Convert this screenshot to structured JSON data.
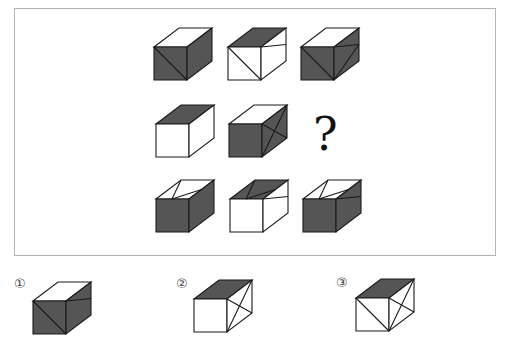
{
  "colors": {
    "dark": "#555555",
    "light": "#ffffff",
    "stroke": "#1a1a1a",
    "frame": "#b4b4b4"
  },
  "puzzle": {
    "question_mark": "?",
    "grid": [
      [
        {
          "id": "r1c1",
          "top": "light",
          "front": "dark",
          "right": "dark",
          "front_lines": [
            "tl-br"
          ],
          "right_lines": [],
          "top_lines": []
        },
        {
          "id": "r1c2",
          "top": "dark",
          "front": "light",
          "right": "light",
          "front_lines": [
            "tl-br"
          ],
          "right_lines": [
            "tl-mr"
          ],
          "top_lines": []
        },
        {
          "id": "r1c3",
          "top": "light",
          "front": "dark",
          "right": "dark",
          "front_lines": [
            "tl-br"
          ],
          "right_lines": [
            "tl-mr",
            "mr-bl"
          ],
          "top_lines": []
        }
      ],
      [
        {
          "id": "r2c1",
          "top": "dark",
          "front": "light",
          "right": "light",
          "front_lines": [],
          "right_lines": [],
          "top_lines": []
        },
        {
          "id": "r2c2",
          "top": "light",
          "front": "dark",
          "right": "dark",
          "front_lines": [],
          "right_lines": [
            "tr-bl",
            "tl-br"
          ],
          "top_lines": []
        },
        null
      ],
      [
        {
          "id": "r3c1",
          "top": "light",
          "front": "light",
          "right": "dark",
          "front_lines": [],
          "right_lines": [],
          "top_lines": [
            "back-fl",
            "back-mr"
          ],
          "front_dark": true
        },
        {
          "id": "r3c2",
          "top": "dark",
          "front": "light",
          "right": "light",
          "front_lines": [],
          "right_lines": [
            "tl-mr"
          ],
          "top_lines": [
            "back-fl",
            "back-mr"
          ]
        },
        {
          "id": "r3c3",
          "top": "light",
          "front": "dark",
          "right": "dark",
          "front_lines": [],
          "right_lines": [
            "tl-mr"
          ],
          "top_lines": [
            "back-fl",
            "back-mr"
          ]
        }
      ]
    ]
  },
  "options": [
    {
      "label": "①",
      "top": "light",
      "front": "dark",
      "right": "dark",
      "front_lines": [
        "tl-br"
      ],
      "right_lines": [
        "tl-mr"
      ]
    },
    {
      "label": "②",
      "top": "dark",
      "front": "light",
      "right": "light",
      "front_lines": [],
      "right_lines": [
        "tr-bl",
        "tl-br"
      ]
    },
    {
      "label": "③",
      "top": "dark",
      "front": "light",
      "right": "light",
      "front_lines": [
        "tl-br"
      ],
      "right_lines": [
        "tr-bl",
        "tl-br"
      ]
    }
  ]
}
